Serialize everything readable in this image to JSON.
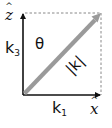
{
  "diagram": {
    "title": "",
    "axes": {
      "vertical": {
        "label": "z",
        "hat": "^",
        "full_label": "ẑ"
      },
      "horizontal": {
        "label": "x",
        "hat": "^",
        "full_label": "x̂"
      }
    },
    "vector": {
      "label": "|k|",
      "color": "#9a9a9a"
    },
    "components": {
      "vertical": {
        "base": "k",
        "sub": "3"
      },
      "horizontal": {
        "base": "k",
        "sub": "1"
      }
    },
    "angle": {
      "label": "θ"
    },
    "colors": {
      "axis": "#111111",
      "dashed": "#888888",
      "vector": "#9a9a9a",
      "background": "#ffffff"
    }
  }
}
